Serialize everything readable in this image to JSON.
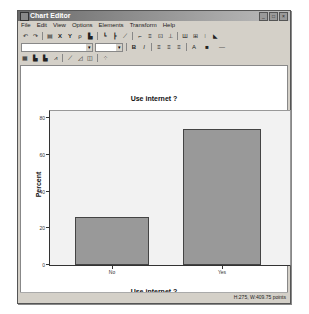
{
  "window": {
    "title": "Chart Editor",
    "controls": [
      "_",
      "□",
      "×"
    ]
  },
  "menubar": {
    "items": [
      "File",
      "Edit",
      "View",
      "Options",
      "Elements",
      "Transform",
      "Help"
    ]
  },
  "toolbar": {
    "row1_icons": [
      "undo-icon",
      "redo-icon",
      "properties-icon",
      "x-axis-icon",
      "y-axis-icon",
      "lasso-icon",
      "bar-icon",
      "reference-line-y-icon",
      "reference-line-x-icon",
      "fit-line-icon",
      "interpolation-icon",
      "annotation-icon",
      "text-box-icon",
      "footnote-icon",
      "data-labels-icon",
      "error-bars-icon",
      "legend-icon",
      "select-icon"
    ],
    "row2": {
      "font_combo": "",
      "size_combo": "",
      "bold": "B",
      "italic": "I",
      "align_icons": [
        "align-left-icon",
        "align-center-icon",
        "align-right-icon"
      ],
      "text_color": "A",
      "fill_color": "■",
      "line_style": "—"
    },
    "row3_icons": [
      "grid-icon",
      "bar-chart-icon",
      "bar-chart-2-icon",
      "line-chart-icon",
      "line-chart-2-icon",
      "area-chart-icon",
      "pie-chart-icon",
      "scatter-icon"
    ]
  },
  "status": {
    "text": "H:275, W:409.75 points"
  },
  "chart_data": {
    "type": "bar",
    "title": "Use internet ?",
    "xlabel": "Use internet ?",
    "ylabel": "Percent",
    "categories": [
      "No",
      "Yes"
    ],
    "values": [
      26,
      74
    ],
    "ylim": [
      0,
      84
    ],
    "yticks": [
      0,
      20,
      40,
      60,
      80
    ],
    "grid": false,
    "legend": "none",
    "bar_color": "#999999",
    "plot_background": "#f2f2f2"
  }
}
